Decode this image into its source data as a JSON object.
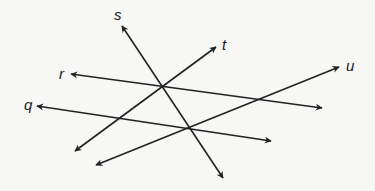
{
  "figure": {
    "width": 375,
    "height": 191,
    "background": "#f7f7f6",
    "line_color": "#222222",
    "lines": [
      {
        "name": "s",
        "label": "s",
        "x1": 122,
        "y1": 26,
        "x2": 223,
        "y2": 178,
        "label_x": 114,
        "label_y": 20
      },
      {
        "name": "t",
        "label": "t",
        "x1": 216,
        "y1": 47,
        "x2": 75,
        "y2": 151,
        "label_x": 222,
        "label_y": 50
      },
      {
        "name": "r",
        "label": "r",
        "x1": 71,
        "y1": 74,
        "x2": 322,
        "y2": 108,
        "label_x": 59,
        "label_y": 79
      },
      {
        "name": "q",
        "label": "q",
        "x1": 37,
        "y1": 106,
        "x2": 271,
        "y2": 141,
        "label_x": 24,
        "label_y": 110
      },
      {
        "name": "u",
        "label": "u",
        "x1": 339,
        "y1": 67,
        "x2": 96,
        "y2": 165,
        "label_x": 346,
        "label_y": 71
      }
    ],
    "intersections": [
      {
        "lines": [
          "s",
          "t",
          "r"
        ],
        "x": 162,
        "y": 86
      },
      {
        "lines": [
          "s",
          "q",
          "u"
        ],
        "x": 190,
        "y": 128
      }
    ]
  }
}
